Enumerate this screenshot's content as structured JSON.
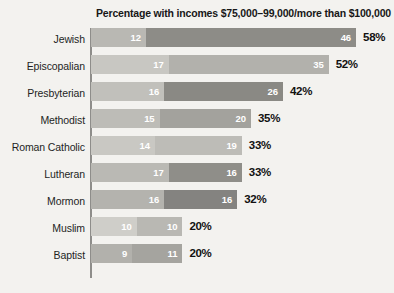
{
  "chart_data": {
    "type": "bar",
    "orientation": "horizontal",
    "stacked": true,
    "title": "Percentage with incomes $75,000–99,000/more than $100,000",
    "xlabel": "",
    "ylabel": "",
    "grid": false,
    "legend_position": "none",
    "axis_line": "left",
    "value_suffix": "%",
    "categories": [
      "Jewish",
      "Episcopalian",
      "Presbyterian",
      "Methodist",
      "Roman Catholic",
      "Lutheran",
      "Mormon",
      "Muslim",
      "Baptist"
    ],
    "series": [
      {
        "name": "$75,000–99,000",
        "values": [
          12,
          17,
          16,
          15,
          14,
          17,
          16,
          10,
          9
        ]
      },
      {
        "name": "more than $100,000",
        "values": [
          46,
          35,
          26,
          20,
          19,
          16,
          16,
          10,
          11
        ]
      }
    ],
    "totals": [
      58,
      52,
      42,
      35,
      33,
      33,
      32,
      20,
      20
    ],
    "total_labels": [
      "58%",
      "52%",
      "42%",
      "35%",
      "33%",
      "33%",
      "32%",
      "20%",
      "20%"
    ],
    "xlim": [
      0,
      58
    ]
  },
  "rows": [
    {
      "label": "Jewish",
      "seg1": "12",
      "seg2": "46",
      "total": "58%",
      "seg1_value": 12,
      "seg2_value": 46,
      "seg1_color": "#b9b8b3",
      "seg2_color": "#8d8c87"
    },
    {
      "label": "Episcopalian",
      "seg1": "17",
      "seg2": "35",
      "total": "52%",
      "seg1_value": 17,
      "seg2_value": 35,
      "seg1_color": "#c8c7c2",
      "seg2_color": "#b2b1ac"
    },
    {
      "label": "Presbyterian",
      "seg1": "16",
      "seg2": "26",
      "total": "42%",
      "seg1_value": 16,
      "seg2_value": 26,
      "seg1_color": "#c1c0bb",
      "seg2_color": "#8a8984"
    },
    {
      "label": "Methodist",
      "seg1": "15",
      "seg2": "20",
      "total": "35%",
      "seg1_value": 15,
      "seg2_value": 20,
      "seg1_color": "#bdbcb7",
      "seg2_color": "#a3a29d"
    },
    {
      "label": "Roman Catholic",
      "seg1": "14",
      "seg2": "19",
      "total": "33%",
      "seg1_value": 14,
      "seg2_value": 19,
      "seg1_color": "#c9c8c3",
      "seg2_color": "#bdbcb7"
    },
    {
      "label": "Lutheran",
      "seg1": "17",
      "seg2": "16",
      "total": "33%",
      "seg1_value": 17,
      "seg2_value": 16,
      "seg1_color": "#bab9b4",
      "seg2_color": "#8f8e89"
    },
    {
      "label": "Mormon",
      "seg1": "16",
      "seg2": "16",
      "total": "32%",
      "seg1_value": 16,
      "seg2_value": 16,
      "seg1_color": "#b4b3ae",
      "seg2_color": "#848380"
    },
    {
      "label": "Muslim",
      "seg1": "10",
      "seg2": "10",
      "total": "20%",
      "seg1_value": 10,
      "seg2_value": 10,
      "seg1_color": "#cfcec9",
      "seg2_color": "#b9b8b3"
    },
    {
      "label": "Baptist",
      "seg1": "9",
      "seg2": "11",
      "total": "20%",
      "seg1_value": 9,
      "seg2_value": 11,
      "seg1_color": "#b2b1ac",
      "seg2_color": "#a5a49f"
    }
  ],
  "layout": {
    "px_per_percent": 4.57,
    "row_height": 27,
    "bar_height": 19,
    "axis_x": 90,
    "background_color": "#f3f2ef",
    "axis_color": "#8e8d8a",
    "title_color": "#171717",
    "label_color": "#231f1e",
    "total_color": "#111111",
    "value_color": "#ffffff"
  }
}
